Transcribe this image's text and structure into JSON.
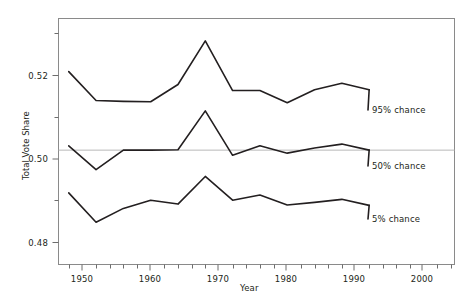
{
  "chart_data": {
    "type": "line",
    "title": "",
    "xlabel": "Year",
    "ylabel": "Total Vote Share",
    "xlim": [
      1946.5,
      2004.5
    ],
    "ylim": [
      0.4735,
      0.5305
    ],
    "grid": false,
    "legend_position": "inline-right-end-of-line",
    "x_ticks": [
      1950,
      1960,
      1970,
      1980,
      1990,
      2000
    ],
    "x_tick_labels": [
      "1950",
      "1960",
      "1970",
      "1980",
      "1990",
      "2000"
    ],
    "x_minor_ticks": [
      1948,
      1952,
      1954,
      1956,
      1958,
      1962,
      1964,
      1966,
      1968,
      1972,
      1974,
      1976,
      1978,
      1982,
      1984,
      1986,
      1988,
      1992,
      1994,
      1996,
      1998,
      2002,
      2004
    ],
    "y_ticks": [
      0.48,
      0.5,
      0.52
    ],
    "y_tick_labels": [
      "0.48",
      "0.50",
      "0.52"
    ],
    "y_minor_ticks": [
      0.49,
      0.51,
      0.53
    ],
    "reference_line": 0.5,
    "x": [
      1948,
      1952,
      1956,
      1960,
      1964,
      1968,
      1972,
      1976,
      1980,
      1984,
      1988,
      1992
    ],
    "series": [
      {
        "name": "95% chance",
        "label": "95% chance",
        "values": [
          0.5182,
          0.5115,
          0.5113,
          0.5112,
          0.5152,
          0.5253,
          0.5138,
          0.5138,
          0.511,
          0.514,
          0.5155,
          0.514
        ]
      },
      {
        "name": "50% chance",
        "label": "50% chance",
        "values": [
          0.501,
          0.4955,
          0.5,
          0.5,
          0.5001,
          0.5091,
          0.4988,
          0.501,
          0.4993,
          0.5005,
          0.5014,
          0.5
        ]
      },
      {
        "name": "5% chance",
        "label": "5% chance",
        "values": [
          0.4901,
          0.4833,
          0.4865,
          0.4884,
          0.4875,
          0.4939,
          0.4884,
          0.4896,
          0.4873,
          0.4879,
          0.4886,
          0.4872
        ]
      }
    ]
  },
  "labels": {
    "series_95": "95% chance",
    "series_50": "50% chance",
    "series_5": "5% chance",
    "x_axis_title": "Year",
    "y_axis_title": "Total Vote Share",
    "ytick_048": "0.48",
    "ytick_050": "0.50",
    "ytick_052": "0.52",
    "xtick_1950": "1950",
    "xtick_1960": "1960",
    "xtick_1970": "1970",
    "xtick_1980": "1980",
    "xtick_1990": "1990",
    "xtick_2000": "2000"
  },
  "colors": {
    "line": "#231f20",
    "axis": "#8a8a8a",
    "reference": "#b8b8b8",
    "background": "#ffffff",
    "text": "#231f20"
  }
}
